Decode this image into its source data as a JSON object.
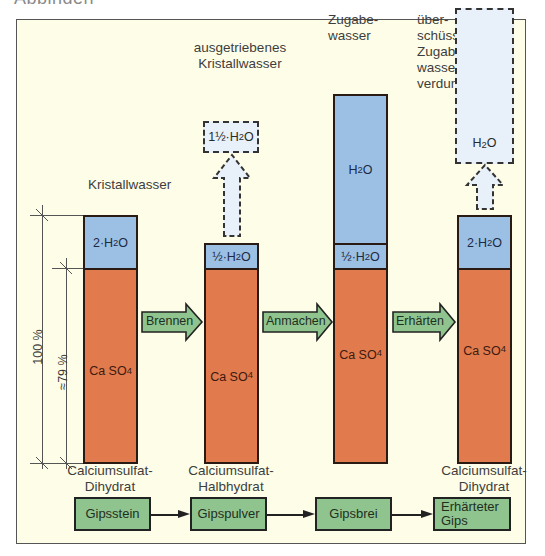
{
  "cut_title": "Abbinden",
  "top_labels": {
    "col1": "Kristallwasser",
    "col2": [
      "ausgetriebenes",
      "Kristallwasser"
    ],
    "col3": [
      "Zugabe-",
      "wasser"
    ],
    "col4": [
      "über-",
      "schüssiges",
      "Zugabe-",
      "wasser",
      "verdunstet"
    ]
  },
  "dashed_boxes": {
    "col2": {
      "prefix": "1½·H",
      "sub": "2",
      "suffix": "O"
    },
    "col4": {
      "prefix": "H",
      "sub": "2",
      "suffix": "O"
    }
  },
  "columns": [
    {
      "water_label": {
        "prefix": "2·H",
        "sub": "2",
        "suffix": "O"
      },
      "salt_label": {
        "prefix": "Ca SO",
        "sub": "4"
      },
      "bottom_label": [
        "Calciumsulfat-",
        "Dihydrat"
      ]
    },
    {
      "water_label": {
        "prefix": "½·H",
        "sub": "2",
        "suffix": "O"
      },
      "salt_label": {
        "prefix": "Ca SO",
        "sub": "4"
      },
      "bottom_label": [
        "Calciumsulfat-",
        "Halbhydrat"
      ]
    },
    {
      "extra_water_label": {
        "prefix": "H",
        "sub": "2",
        "suffix": "O"
      },
      "water_label": {
        "prefix": "½·H",
        "sub": "2",
        "suffix": "O"
      },
      "salt_label": {
        "prefix": "Ca SO",
        "sub": "4"
      },
      "bottom_label": []
    },
    {
      "water_label": {
        "prefix": "2·H",
        "sub": "2",
        "suffix": "O"
      },
      "salt_label": {
        "prefix": "Ca SO",
        "sub": "4"
      },
      "bottom_label": [
        "Calciumsulfat-",
        "Dihydrat"
      ]
    }
  ],
  "process_arrows": [
    "Brennen",
    "Anmachen",
    "Erhärten"
  ],
  "dimensions": {
    "total": "100 %",
    "salt_share": "≈79 %"
  },
  "flow_boxes": [
    "Gipsstein",
    "Gipspulver",
    "Gipsbrei",
    "Erhärteter Gips"
  ],
  "colors": {
    "background": "#fefde8",
    "water": "#9cc0e4",
    "salt": "#e17a4c",
    "process": "#8fc48f",
    "evaporated": "#e8f1f9"
  }
}
